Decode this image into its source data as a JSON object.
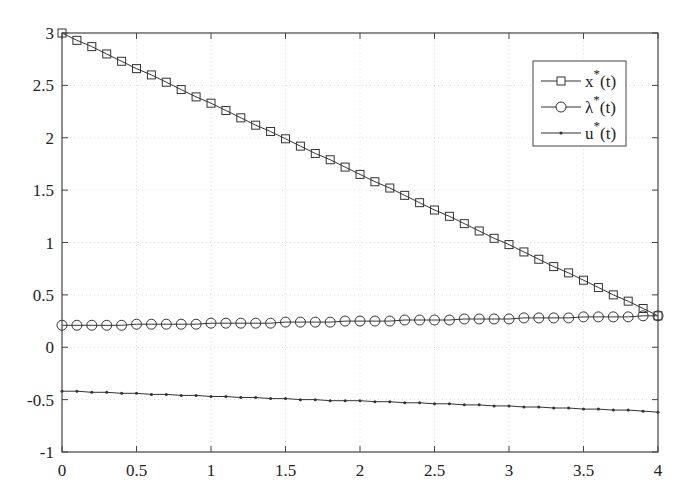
{
  "chart_data": {
    "type": "line",
    "title": "",
    "xlabel": "",
    "ylabel": "",
    "xlim": [
      0,
      4
    ],
    "ylim": [
      -1,
      3
    ],
    "grid": true,
    "legend_position": "upper right",
    "x_ticks": [
      "0",
      "0.5",
      "1",
      "1.5",
      "2",
      "2.5",
      "3",
      "3.5",
      "4"
    ],
    "y_ticks": [
      "-1",
      "-0.5",
      "0",
      "0.5",
      "1",
      "1.5",
      "2",
      "2.5",
      "3"
    ],
    "x": [
      0,
      0.1,
      0.2,
      0.3,
      0.4,
      0.5,
      0.6,
      0.7,
      0.8,
      0.9,
      1.0,
      1.1,
      1.2,
      1.3,
      1.4,
      1.5,
      1.6,
      1.7,
      1.8,
      1.9,
      2.0,
      2.1,
      2.2,
      2.3,
      2.4,
      2.5,
      2.6,
      2.7,
      2.8,
      2.9,
      3.0,
      3.1,
      3.2,
      3.3,
      3.4,
      3.5,
      3.6,
      3.7,
      3.8,
      3.9,
      4.0
    ],
    "series": [
      {
        "name": "x*(t)",
        "label_base": "x",
        "marker": "square",
        "start": 3.0,
        "end": 0.3,
        "values": [
          3.0,
          2.93,
          2.87,
          2.8,
          2.73,
          2.66,
          2.6,
          2.53,
          2.46,
          2.39,
          2.33,
          2.26,
          2.19,
          2.12,
          2.06,
          1.99,
          1.92,
          1.85,
          1.79,
          1.72,
          1.65,
          1.58,
          1.52,
          1.45,
          1.38,
          1.31,
          1.25,
          1.18,
          1.11,
          1.04,
          0.98,
          0.91,
          0.84,
          0.77,
          0.71,
          0.64,
          0.57,
          0.5,
          0.44,
          0.37,
          0.3
        ]
      },
      {
        "name": "λ*(t)",
        "label_base": "λ",
        "marker": "circle",
        "start": 0.21,
        "end": 0.3,
        "values": [
          0.21,
          0.21,
          0.21,
          0.21,
          0.21,
          0.22,
          0.22,
          0.22,
          0.22,
          0.22,
          0.23,
          0.23,
          0.23,
          0.23,
          0.23,
          0.24,
          0.24,
          0.24,
          0.24,
          0.25,
          0.25,
          0.25,
          0.25,
          0.26,
          0.26,
          0.26,
          0.26,
          0.27,
          0.27,
          0.27,
          0.27,
          0.28,
          0.28,
          0.28,
          0.28,
          0.29,
          0.29,
          0.29,
          0.29,
          0.3,
          0.3
        ]
      },
      {
        "name": "u*(t)",
        "label_base": "u",
        "marker": "dot",
        "start": -0.42,
        "end": -0.62,
        "values": [
          -0.42,
          -0.42,
          -0.43,
          -0.43,
          -0.44,
          -0.44,
          -0.45,
          -0.45,
          -0.46,
          -0.46,
          -0.47,
          -0.47,
          -0.48,
          -0.48,
          -0.49,
          -0.49,
          -0.5,
          -0.5,
          -0.51,
          -0.51,
          -0.51,
          -0.52,
          -0.52,
          -0.53,
          -0.53,
          -0.54,
          -0.54,
          -0.55,
          -0.55,
          -0.56,
          -0.56,
          -0.57,
          -0.57,
          -0.58,
          -0.58,
          -0.59,
          -0.59,
          -0.6,
          -0.6,
          -0.61,
          -0.62
        ]
      }
    ]
  },
  "legend": {
    "items": [
      {
        "base": "x",
        "sup": "*",
        "suffix": "(t)"
      },
      {
        "base": "λ",
        "sup": "*",
        "suffix": "(t)"
      },
      {
        "base": "u",
        "sup": "*",
        "suffix": "(t)"
      }
    ]
  },
  "colors": {
    "line": "#333333",
    "axis": "#444444",
    "grid": "#d0d0d0",
    "background": "#ffffff"
  }
}
